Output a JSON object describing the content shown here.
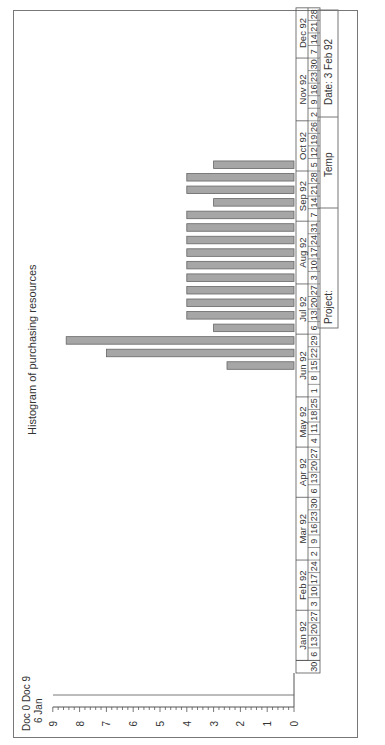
{
  "chart_data": {
    "type": "bar",
    "title": "Histogram of purchasing resources",
    "xlabel": "",
    "ylabel": "",
    "ylim": [
      0,
      9
    ],
    "y_ticks": [
      "0",
      "1",
      "2",
      "3",
      "4",
      "5",
      "6",
      "7",
      "8",
      "9"
    ],
    "corner_label_line1": "Doc 0 Doc 9",
    "corner_label_line2": "6 Jan",
    "months": [
      {
        "label": "Jan 92",
        "weeks": [
          "6",
          "13",
          "20",
          "27"
        ]
      },
      {
        "label": "Feb 92",
        "weeks": [
          "3",
          "10",
          "17",
          "24"
        ]
      },
      {
        "label": "Mar 92",
        "weeks": [
          "2",
          "9",
          "16",
          "23",
          "30"
        ]
      },
      {
        "label": "Apr 92",
        "weeks": [
          "6",
          "13",
          "20",
          "27"
        ]
      },
      {
        "label": "May 92",
        "weeks": [
          "4",
          "11",
          "18",
          "25"
        ]
      },
      {
        "label": "Jun 92",
        "weeks": [
          "1",
          "8",
          "15",
          "22",
          "29"
        ]
      },
      {
        "label": "Jul 92",
        "weeks": [
          "6",
          "13",
          "20",
          "27"
        ]
      },
      {
        "label": "Aug 92",
        "weeks": [
          "3",
          "10",
          "17",
          "24",
          "31"
        ]
      },
      {
        "label": "Sep 92",
        "weeks": [
          "7",
          "14",
          "21",
          "28"
        ]
      },
      {
        "label": "Oct 92",
        "weeks": [
          "5",
          "12",
          "19",
          "26"
        ]
      },
      {
        "label": "Nov 92",
        "weeks": [
          "2",
          "9",
          "16",
          "23",
          "30"
        ]
      },
      {
        "label": "Dec 92",
        "weeks": [
          "7",
          "14",
          "21",
          "28"
        ]
      }
    ],
    "leading_week": "30",
    "categories": [
      "Jun 8",
      "Jun 15",
      "Jun 22",
      "Jun 29",
      "Jul 6",
      "Jul 13",
      "Jul 20",
      "Jul 27",
      "Aug 3",
      "Aug 10",
      "Aug 17",
      "Aug 24",
      "Aug 31",
      "Sep 7",
      "Sep 14",
      "Sep 21",
      "Sep 28"
    ],
    "values": [
      2.5,
      7,
      8.5,
      3,
      4,
      4,
      4,
      4,
      4,
      4,
      4,
      4,
      4,
      3,
      4,
      4,
      3
    ],
    "bar_color": "#a6a6a6",
    "bar_start_week_index": 24
  },
  "footer": {
    "project_label": "Project:",
    "temp_label": "Temp",
    "date_label": "Date:  3 Feb 92"
  }
}
